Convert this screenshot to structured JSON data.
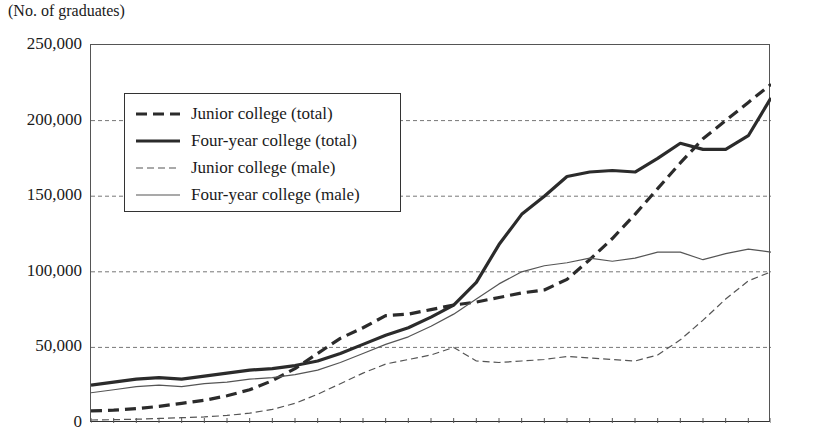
{
  "axis_unit_label": "(No. of graduates)",
  "y_ticks": [
    "250,000",
    "200,000",
    "150,000",
    "100,000",
    "50,000",
    "0"
  ],
  "legend": {
    "items": [
      {
        "label": "Junior college (total)",
        "style": "thick-dashed"
      },
      {
        "label": "Four-year college (total)",
        "style": "thick-solid"
      },
      {
        "label": "Junior college (male)",
        "style": "thin-dashed"
      },
      {
        "label": "Four-year college (male)",
        "style": "thin-solid"
      }
    ]
  },
  "chart_data": {
    "type": "line",
    "title": "",
    "subtitle": "",
    "xlabel": "",
    "ylabel": "(No. of graduates)",
    "ylim": [
      0,
      250000
    ],
    "ytick_values": [
      0,
      50000,
      100000,
      150000,
      200000,
      250000
    ],
    "grid": "horizontal-dashed",
    "legend_position": "upper-left-inside",
    "x_tick_count": 31,
    "x_axis_labels_shown": false,
    "x": [
      0,
      1,
      2,
      3,
      4,
      5,
      6,
      7,
      8,
      9,
      10,
      11,
      12,
      13,
      14,
      15,
      16,
      17,
      18,
      19,
      20,
      21,
      22,
      23,
      24,
      25,
      26,
      27,
      28,
      29,
      30
    ],
    "series": [
      {
        "name": "Junior college (total)",
        "style": "thick-dashed",
        "values": [
          8000,
          8500,
          9500,
          11000,
          13000,
          15000,
          18000,
          22000,
          28000,
          36000,
          46000,
          56000,
          63000,
          71000,
          72000,
          75000,
          78000,
          80000,
          83000,
          86000,
          88000,
          95000,
          108000,
          122000,
          138000,
          155000,
          172000,
          188000,
          200000,
          212000,
          224000
        ]
      },
      {
        "name": "Four-year college (total)",
        "style": "thick-solid",
        "values": [
          25000,
          27000,
          29000,
          30000,
          29000,
          31000,
          33000,
          35000,
          36000,
          38000,
          41000,
          46000,
          52000,
          58000,
          63000,
          70000,
          78000,
          93000,
          118000,
          138000,
          150000,
          163000,
          166000,
          167000,
          166000,
          175000,
          185000,
          181000,
          181000,
          190000,
          215000
        ]
      },
      {
        "name": "Junior college (male)",
        "style": "thin-dashed",
        "values": [
          2000,
          2200,
          2500,
          3000,
          3500,
          4000,
          5000,
          6500,
          9000,
          13000,
          19000,
          26000,
          33000,
          39000,
          42000,
          45000,
          50000,
          41000,
          40000,
          41000,
          42000,
          44000,
          43000,
          42000,
          41000,
          45000,
          55000,
          68000,
          82000,
          94000,
          100000
        ]
      },
      {
        "name": "Four-year college (male)",
        "style": "thin-solid",
        "values": [
          20000,
          22000,
          24000,
          25000,
          24000,
          26000,
          27000,
          29000,
          30000,
          32000,
          35000,
          40000,
          46000,
          52000,
          57000,
          64000,
          72000,
          82000,
          92000,
          100000,
          104000,
          106000,
          109000,
          107000,
          109000,
          113000,
          113000,
          108000,
          112000,
          115000,
          113000
        ]
      }
    ]
  }
}
